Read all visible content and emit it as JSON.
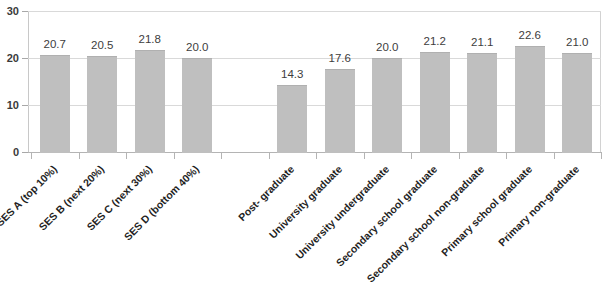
{
  "chart_data": {
    "type": "bar",
    "title": "",
    "xlabel": "",
    "ylabel": "",
    "ylim": [
      0,
      30
    ],
    "yticks": [
      0,
      10,
      20,
      30
    ],
    "ytick_labels": [
      "0",
      "10",
      "20",
      "30"
    ],
    "grid": true,
    "legend": false,
    "bar_color": "#bfbfbf",
    "label_color": "#3d3d3d",
    "gridline_color": "#d9d9d9",
    "categories": [
      "SES A (top 10%)",
      "SES B (next 20%)",
      "SES C (next 30%)",
      "SES D (bottom 40%)",
      "",
      "Post- graduate",
      "University graduate",
      "University undergraduate",
      "Secondary school graduate",
      "Secondary school non-graduate",
      "Primary school graduate",
      "Primary non-graduate"
    ],
    "values": [
      20.7,
      20.5,
      21.8,
      20.0,
      null,
      14.3,
      17.6,
      20.0,
      21.2,
      21.1,
      22.6,
      21.0
    ],
    "value_labels": [
      "20.7",
      "20.5",
      "21.8",
      "20.0",
      "",
      "14.3",
      "17.6",
      "20.0",
      "21.2",
      "21.1",
      "22.6",
      "21.0"
    ]
  }
}
